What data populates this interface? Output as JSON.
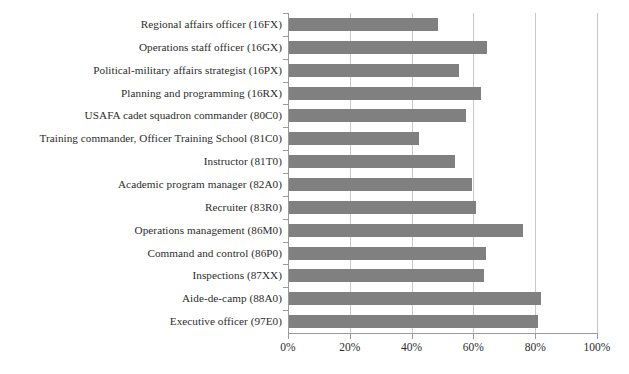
{
  "chart_data": {
    "type": "bar",
    "orientation": "horizontal",
    "title": "",
    "subtitle": "",
    "xlabel": "",
    "ylabel": "",
    "xlim": [
      0,
      100
    ],
    "xtick_labels": [
      "0%",
      "20%",
      "40%",
      "60%",
      "80%",
      "100%"
    ],
    "xtick_values": [
      0,
      20,
      40,
      60,
      80,
      100
    ],
    "grid": true,
    "legend": null,
    "units": "percent",
    "bar_color": "#808080",
    "categories": [
      "Regional affairs officer (16FX)",
      "Operations staff officer (16GX)",
      "Political-military affairs strategist (16PX)",
      "Planning and programming (16RX)",
      "USAFA cadet squadron commander (80C0)",
      "Training commander, Officer Training School (81C0)",
      "Instructor (81T0)",
      "Academic program manager (82A0)",
      "Recruiter (83R0)",
      "Operations management (86M0)",
      "Command and control (86P0)",
      "Inspections (87XX)",
      "Aide-de-camp (88A0)",
      "Executive officer (97E0)"
    ],
    "values": [
      48.5,
      64.5,
      55.5,
      62.5,
      57.5,
      42.5,
      54.0,
      59.5,
      61.0,
      76.0,
      64.0,
      63.5,
      82.0,
      81.0
    ]
  }
}
